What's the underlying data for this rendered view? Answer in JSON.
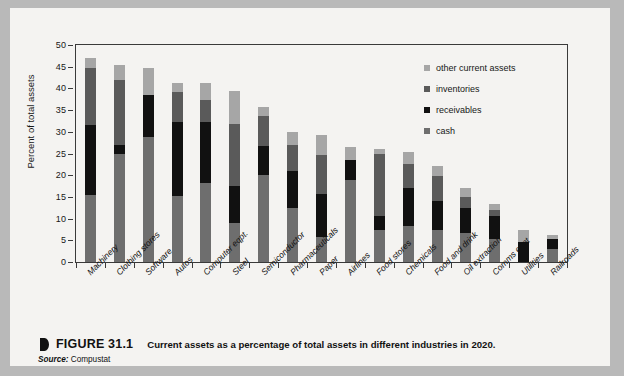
{
  "figure": {
    "marker_icon": "figure-bullet-icon",
    "number": "FIGURE 31.1",
    "caption": "Current assets as a percentage of total assets in different industries in 2020.",
    "source_label": "Source:",
    "source_value": "Compustat"
  },
  "legend": {
    "position": "inside-top-right",
    "items": [
      {
        "label": "other current assets",
        "color": "#a6a6a6"
      },
      {
        "label": "inventories",
        "color": "#5a5a5a"
      },
      {
        "label": "receivables",
        "color": "#111111"
      },
      {
        "label": "cash",
        "color": "#6e6e6e"
      }
    ]
  },
  "chart_data": {
    "type": "bar",
    "stacked": true,
    "title": "Current assets as a percentage of total assets in different industries in 2020.",
    "xlabel": "",
    "ylabel": "Percent of total assets",
    "ylim": [
      0,
      50
    ],
    "yticks": [
      0,
      5,
      10,
      15,
      20,
      25,
      30,
      35,
      40,
      45,
      50
    ],
    "grid": false,
    "categories": [
      "Machinery",
      "Clothing stores",
      "Software",
      "Autos",
      "Computer eqpt.",
      "Steel",
      "Semiconductor",
      "Pharmaceuticals",
      "Paper",
      "Airlines",
      "Food stores",
      "Chemicals",
      "Food and drink",
      "Oil extraction",
      "Comms eqpt",
      "Utilities",
      "Railroads"
    ],
    "series": [
      {
        "name": "cash",
        "color": "#6e6e6e",
        "values": [
          15.4,
          25.0,
          28.8,
          15.2,
          18.3,
          9.0,
          20.0,
          12.4,
          5.8,
          19.0,
          7.4,
          8.4,
          7.4,
          6.6,
          5.2,
          0.0,
          3.0
        ]
      },
      {
        "name": "receivables",
        "color": "#111111",
        "values": [
          16.1,
          2.0,
          9.6,
          17.1,
          14.0,
          8.5,
          6.7,
          8.5,
          9.8,
          4.5,
          3.1,
          8.7,
          6.6,
          5.9,
          5.4,
          4.7,
          2.2
        ]
      },
      {
        "name": "inventories",
        "color": "#5a5a5a",
        "values": [
          13.3,
          15.0,
          0.0,
          6.8,
          5.1,
          14.3,
          6.9,
          6.0,
          9.0,
          0.0,
          14.5,
          5.6,
          5.9,
          2.4,
          1.4,
          0.0,
          0.0
        ]
      },
      {
        "name": "other current assets",
        "color": "#a6a6a6",
        "values": [
          2.2,
          3.3,
          6.4,
          2.2,
          3.8,
          7.7,
          2.1,
          3.0,
          4.6,
          3.0,
          1.0,
          2.6,
          2.3,
          2.2,
          1.3,
          2.7,
          1.1
        ]
      }
    ],
    "totals": [
      47.0,
      45.3,
      44.8,
      41.3,
      41.2,
      39.5,
      35.7,
      29.9,
      29.2,
      26.5,
      26.0,
      25.3,
      22.2,
      17.1,
      13.3,
      7.4,
      6.3
    ]
  }
}
